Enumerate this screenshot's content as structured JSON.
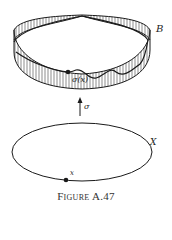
{
  "figure": {
    "caption": "Figure A.47",
    "labels": {
      "bundle": "B",
      "section_point": "σ(x)",
      "section_map": "σ",
      "base_space": "X",
      "base_point": "x"
    },
    "elements": [
      {
        "type": "twisted-band",
        "description": "Möbius-like band with vertical hatch fibers, pinched at top"
      },
      {
        "type": "section-curve",
        "description": "wavy curve along band through σ(x)"
      },
      {
        "type": "arrow",
        "direction": "up",
        "label": "σ"
      },
      {
        "type": "ellipse",
        "description": "base circle X"
      },
      {
        "type": "point",
        "label": "x"
      }
    ],
    "colors": {
      "ink": "#1a1a1a",
      "background": "#ffffff"
    }
  }
}
